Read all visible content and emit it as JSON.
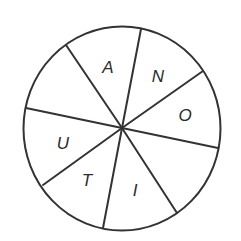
{
  "diagram": {
    "type": "letter-wheel",
    "sectors": 8,
    "center": [
      122,
      128
    ],
    "radius": [
      99,
      102
    ],
    "stroke_color": "#333333",
    "spokes": [
      [
        141,
        29
      ],
      [
        203,
        71
      ],
      [
        218,
        148
      ],
      [
        177,
        213
      ],
      [
        103,
        228
      ],
      [
        43,
        185
      ],
      [
        26,
        108
      ],
      [
        66,
        45
      ]
    ],
    "letters": [
      {
        "char": "A",
        "x": 108,
        "y": 73
      },
      {
        "char": "N",
        "x": 158,
        "y": 82
      },
      {
        "char": "O",
        "x": 185,
        "y": 121
      },
      {
        "char": "I",
        "x": 135,
        "y": 196
      },
      {
        "char": "T",
        "x": 87,
        "y": 186
      },
      {
        "char": "U",
        "x": 63,
        "y": 149
      }
    ],
    "empty_sectors": [
      "upper-left",
      "lower-right"
    ]
  }
}
